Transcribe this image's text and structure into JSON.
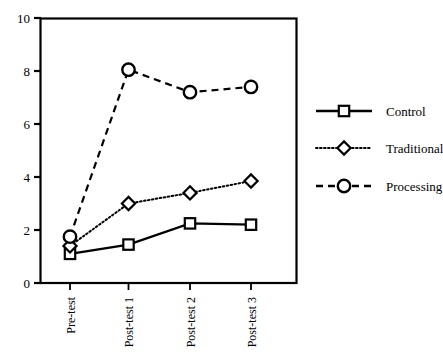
{
  "chart_data": {
    "type": "line",
    "title": "",
    "subtitle": "",
    "xlabel": "",
    "ylabel": "",
    "categories": [
      "Pre-test",
      "Post-test 1",
      "Post-test 2",
      "Post-test 3"
    ],
    "series": [
      {
        "name": "Control",
        "values": [
          1.1,
          1.45,
          2.25,
          2.2
        ],
        "marker": "square",
        "linestyle": "solid",
        "color": "#000000"
      },
      {
        "name": "Traditional",
        "values": [
          1.4,
          3.0,
          3.4,
          3.85
        ],
        "marker": "diamond",
        "linestyle": "dotted",
        "color": "#000000"
      },
      {
        "name": "Processing",
        "values": [
          1.75,
          8.05,
          7.2,
          7.4
        ],
        "marker": "circle",
        "linestyle": "dashed",
        "color": "#000000"
      }
    ],
    "ylim": [
      0,
      10
    ],
    "yticks": [
      0,
      2,
      4,
      6,
      8,
      10
    ],
    "ytick_labels": [
      "0",
      "2",
      "4",
      "6",
      "8",
      "10"
    ],
    "xtick_labels": [
      "Pre-test",
      "Post-test 1",
      "Post-test 2",
      "Post-test 3"
    ],
    "xtick_rotation": 90,
    "grid": false,
    "legend_position": "right",
    "frame": true
  },
  "legend": {
    "entries": [
      {
        "label": "Control",
        "marker": "square",
        "linestyle": "solid"
      },
      {
        "label": "Traditional",
        "marker": "diamond",
        "linestyle": "dotted"
      },
      {
        "label": "Processing",
        "marker": "circle",
        "linestyle": "dashed"
      }
    ]
  },
  "axes": {
    "y_ticks": [
      "0",
      "2",
      "4",
      "6",
      "8",
      "10"
    ],
    "x_ticks": [
      "Pre-test",
      "Post-test 1",
      "Post-test 2",
      "Post-test 3"
    ]
  },
  "colors": {
    "ink": "#000000",
    "background": "#ffffff"
  }
}
